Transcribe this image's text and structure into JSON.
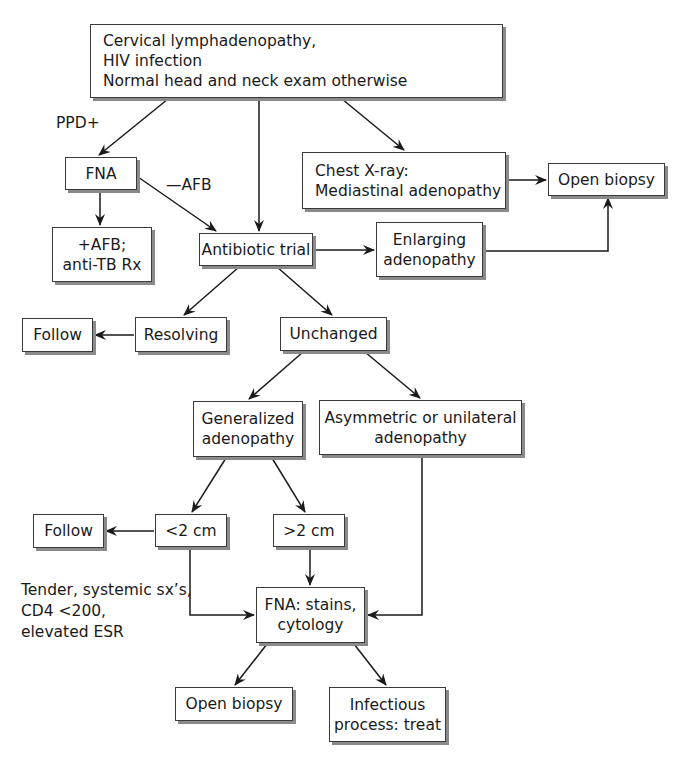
{
  "diagram": {
    "type": "flowchart",
    "nodes": {
      "start": {
        "lines": [
          "Cervical lymphadenopathy,",
          "HIV infection",
          "Normal head and neck exam otherwise"
        ]
      },
      "fna_top": {
        "lines": [
          "FNA"
        ]
      },
      "afb_positive": {
        "lines": [
          "+AFB;",
          "anti-TB Rx"
        ]
      },
      "antibiotic_trial": {
        "lines": [
          "Antibiotic trial"
        ]
      },
      "chest_xray": {
        "lines": [
          "Chest X-ray:",
          "Mediastinal adenopathy"
        ]
      },
      "open_biopsy_top": {
        "lines": [
          "Open biopsy"
        ]
      },
      "enlarging": {
        "lines": [
          "Enlarging",
          "adenopathy"
        ]
      },
      "follow_1": {
        "lines": [
          "Follow"
        ]
      },
      "resolving": {
        "lines": [
          "Resolving"
        ]
      },
      "unchanged": {
        "lines": [
          "Unchanged"
        ]
      },
      "generalized": {
        "lines": [
          "Generalized",
          "adenopathy"
        ]
      },
      "asymmetric": {
        "lines": [
          "Asymmetric or unilateral",
          "adenopathy"
        ]
      },
      "follow_2": {
        "lines": [
          "Follow"
        ]
      },
      "lt2cm": {
        "lines": [
          "<2 cm"
        ]
      },
      "gt2cm": {
        "lines": [
          ">2 cm"
        ]
      },
      "fna_stains": {
        "lines": [
          "FNA: stains,",
          "cytology"
        ]
      },
      "open_biopsy_bottom": {
        "lines": [
          "Open biopsy"
        ]
      },
      "infectious": {
        "lines": [
          "Infectious",
          "process: treat"
        ]
      }
    },
    "edge_labels": {
      "ppd_positive": "PPD+",
      "afb_negative": "—AFB",
      "criteria": [
        "Tender, systemic sx’s,",
        "CD4 <200,",
        "elevated ESR"
      ]
    },
    "edges": [
      {
        "from": "start",
        "to": "fna_top",
        "label": "PPD+"
      },
      {
        "from": "start",
        "to": "antibiotic_trial"
      },
      {
        "from": "start",
        "to": "chest_xray"
      },
      {
        "from": "fna_top",
        "to": "afb_positive"
      },
      {
        "from": "fna_top",
        "to": "antibiotic_trial",
        "label": "—AFB"
      },
      {
        "from": "chest_xray",
        "to": "open_biopsy_top"
      },
      {
        "from": "antibiotic_trial",
        "to": "enlarging"
      },
      {
        "from": "enlarging",
        "to": "open_biopsy_top"
      },
      {
        "from": "antibiotic_trial",
        "to": "resolving"
      },
      {
        "from": "antibiotic_trial",
        "to": "unchanged"
      },
      {
        "from": "resolving",
        "to": "follow_1"
      },
      {
        "from": "unchanged",
        "to": "generalized"
      },
      {
        "from": "unchanged",
        "to": "asymmetric"
      },
      {
        "from": "generalized",
        "to": "lt2cm"
      },
      {
        "from": "generalized",
        "to": "gt2cm"
      },
      {
        "from": "lt2cm",
        "to": "follow_2"
      },
      {
        "from": "lt2cm",
        "to": "fna_stains",
        "label": "Tender, systemic sx’s, CD4 <200, elevated ESR"
      },
      {
        "from": "gt2cm",
        "to": "fna_stains"
      },
      {
        "from": "asymmetric",
        "to": "fna_stains"
      },
      {
        "from": "fna_stains",
        "to": "open_biopsy_bottom"
      },
      {
        "from": "fna_stains",
        "to": "infectious"
      }
    ],
    "colors": {
      "line": "#1a1a1a",
      "box_border": "#3a3a3a",
      "box_shadow": "#8a8a8a",
      "background": "#ffffff"
    }
  }
}
